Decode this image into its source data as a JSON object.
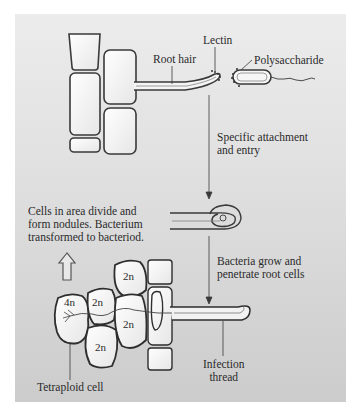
{
  "figure": {
    "background_color": "#dcdcdc",
    "labels": {
      "lectin": "Lectin",
      "root_hair": "Root hair",
      "polysaccharide": "Polysaccharide",
      "step1": "Specific attachment\nand entry",
      "step2": "Bacteria grow and\npenetrate root cells",
      "step3": "Cells in area divide and\nform nodules. Bacterium\ntransformed to bacteriod.",
      "infection_thread": "Infection\nthread",
      "tetraploid_cell": "Tetraploid cell"
    },
    "cells": [
      {
        "ploidy": "4n"
      },
      {
        "ploidy": "2n"
      },
      {
        "ploidy": "2n"
      },
      {
        "ploidy": "2n"
      },
      {
        "ploidy": "2n"
      }
    ],
    "icons": {
      "up_arrow": "hollow-up-arrow",
      "flow_arrow": "down-arrow"
    }
  }
}
